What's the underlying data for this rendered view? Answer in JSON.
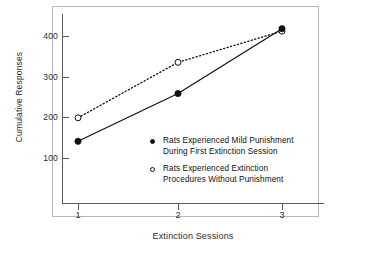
{
  "chart_data": {
    "type": "line",
    "title": "",
    "xlabel": "Extinction Sessions",
    "ylabel": "Cumulative Responses",
    "x": [
      1,
      2,
      3
    ],
    "xtick_labels": [
      "1",
      "2",
      "3"
    ],
    "ytick_labels": [
      "100",
      "200",
      "300",
      "400"
    ],
    "yticks": [
      100,
      200,
      300,
      400
    ],
    "xlim": [
      0.6,
      3.4
    ],
    "ylim": [
      0,
      460
    ],
    "grid": false,
    "legend_position": "inside-lower-right",
    "series": [
      {
        "name": "Rats Experienced Mild Punishment During First Extinction Session",
        "legend_line_1": "Rats Experienced Mild Punishment",
        "legend_line_2": "During First Extinction Session",
        "marker": "filled-circle",
        "linestyle": "solid",
        "color": "#111111",
        "values": [
          140,
          258,
          418
        ]
      },
      {
        "name": "Rats Experienced Extinction Procedures Without Punishment",
        "legend_line_1": "Rats Experienced Extinction",
        "legend_line_2": "Procedures Without Punishment",
        "marker": "open-circle",
        "linestyle": "dotted",
        "color": "#111111",
        "values": [
          198,
          335,
          412
        ]
      }
    ]
  },
  "figure": {
    "frame_color": "#b9b9b9",
    "axis_color": "#5b5b5b",
    "background": "#ffffff"
  }
}
